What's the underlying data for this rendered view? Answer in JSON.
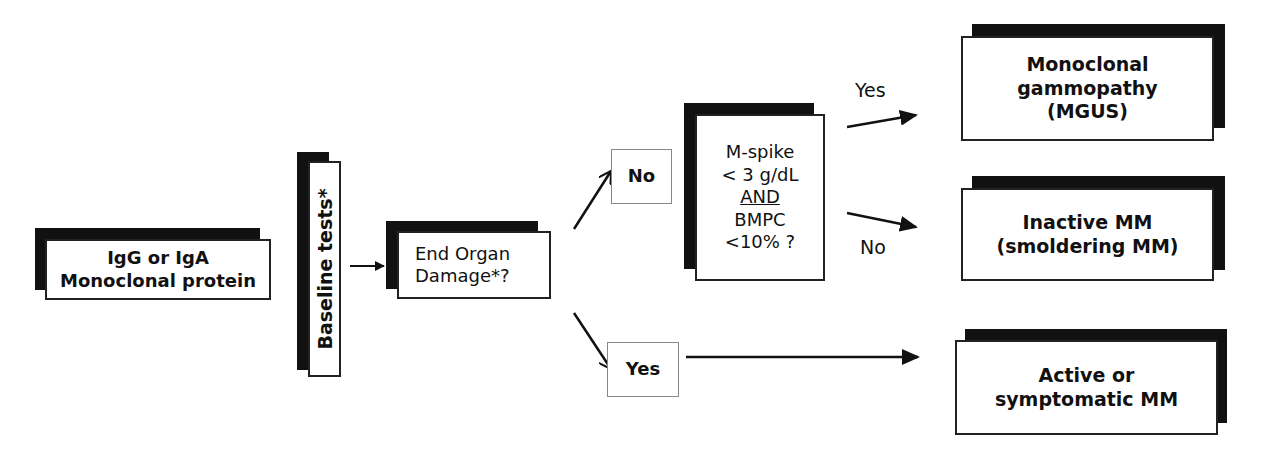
{
  "diagram": {
    "type": "flowchart",
    "nodes": {
      "start": {
        "lines": [
          "IgG or IgA",
          "Monoclonal protein"
        ]
      },
      "baseline": {
        "text": "Baseline tests*"
      },
      "end_organ": {
        "lines": [
          "End Organ",
          "Damage*?"
        ]
      },
      "no_branch": {
        "text": "No"
      },
      "yes_branch": {
        "text": "Yes"
      },
      "criteria": {
        "lines": [
          "M-spike",
          "< 3 g/dL",
          "AND",
          "BMPC",
          "<10% ?"
        ]
      },
      "mgus": {
        "lines": [
          "Monoclonal",
          "gammopathy",
          "(MGUS)"
        ]
      },
      "smoldering": {
        "lines": [
          "Inactive MM",
          "(smoldering MM)"
        ]
      },
      "active": {
        "lines": [
          "Active or",
          "symptomatic MM"
        ]
      }
    },
    "edge_labels": {
      "criteria_yes": "Yes",
      "criteria_no": "No"
    },
    "colors": {
      "shadow": "#111111",
      "border": "#222222",
      "background": "#ffffff"
    }
  }
}
